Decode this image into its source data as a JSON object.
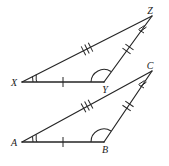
{
  "figure": {
    "background_color": "#ffffff",
    "stroke_color": "#262626",
    "label_color": "#1a1a1a",
    "width": 169,
    "height": 166
  },
  "triangles": [
    {
      "name": "triangle-xyz",
      "vertices": [
        {
          "label": "Z",
          "x": 152,
          "y": 16,
          "label_x": 152,
          "label_y": 13,
          "angle_marks": 3,
          "arc_style": "straight-ticks"
        },
        {
          "label": "X",
          "x": 22,
          "y": 82,
          "label_x": 14,
          "label_y": 85,
          "angle_marks": 2,
          "arc_style": "straight-ticks"
        },
        {
          "label": "Y",
          "x": 104,
          "y": 82,
          "label_x": 104,
          "label_y": 91,
          "angle_marks": 1,
          "arc_style": "arc"
        }
      ],
      "sides": [
        {
          "name": "XY",
          "from": "X",
          "to": "Y",
          "ticks": 1,
          "tick_angle": "vertical"
        },
        {
          "name": "XZ",
          "from": "X",
          "to": "Z",
          "ticks": 3,
          "tick_angle": "cross"
        },
        {
          "name": "YZ",
          "from": "Y",
          "to": "Z",
          "ticks": 2,
          "tick_angle": "cross"
        }
      ]
    },
    {
      "name": "triangle-abc",
      "vertices": [
        {
          "label": "C",
          "x": 152,
          "y": 71,
          "label_x": 152,
          "label_y": 68,
          "angle_marks": 3,
          "arc_style": "straight-ticks"
        },
        {
          "label": "A",
          "x": 22,
          "y": 142,
          "label_x": 14,
          "label_y": 146,
          "angle_marks": 2,
          "arc_style": "straight-ticks"
        },
        {
          "label": "B",
          "x": 104,
          "y": 142,
          "label_x": 104,
          "label_y": 151,
          "angle_marks": 1,
          "arc_style": "arc"
        }
      ],
      "sides": [
        {
          "name": "AB",
          "from": "A",
          "to": "B",
          "ticks": 1,
          "tick_angle": "vertical"
        },
        {
          "name": "AC",
          "from": "A",
          "to": "C",
          "ticks": 3,
          "tick_angle": "cross"
        },
        {
          "name": "BC",
          "from": "B",
          "to": "C",
          "ticks": 2,
          "tick_angle": "cross"
        }
      ]
    }
  ],
  "labels": {
    "z": "Z",
    "x": "X",
    "y": "Y",
    "c": "C",
    "a": "A",
    "b": "B"
  }
}
